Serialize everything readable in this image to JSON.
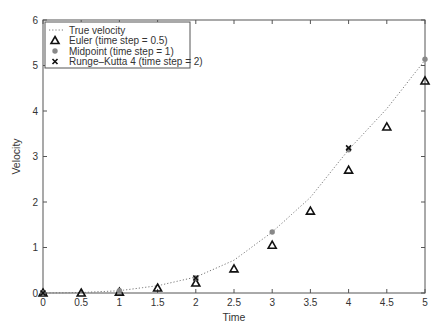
{
  "chart_data": {
    "type": "scatter",
    "title": "",
    "xlabel": "Time",
    "ylabel": "Velocity",
    "xlim": [
      0,
      5
    ],
    "ylim": [
      0,
      6
    ],
    "xticks": [
      "0",
      "0.5",
      "1",
      "1.5",
      "2",
      "2.5",
      "3",
      "3.5",
      "4",
      "4.5",
      "5"
    ],
    "yticks": [
      "0",
      "1",
      "2",
      "3",
      "4",
      "5",
      "6"
    ],
    "grid": false,
    "legend_position": "upper left",
    "series": [
      {
        "name": "True velocity",
        "style": "dotted-line",
        "x": [
          0,
          0.5,
          1,
          1.5,
          2,
          2.5,
          3,
          3.5,
          4,
          4.5,
          5
        ],
        "y": [
          0,
          0.01,
          0.05,
          0.16,
          0.35,
          0.72,
          1.34,
          2.1,
          3.15,
          4.05,
          5.12
        ]
      },
      {
        "name": "Euler (time step = 0.5)",
        "marker": "triangle",
        "x": [
          0,
          0.5,
          1,
          1.5,
          2,
          2.5,
          3,
          3.5,
          4,
          4.5,
          5
        ],
        "y": [
          0,
          0.0,
          0.02,
          0.11,
          0.22,
          0.53,
          1.05,
          1.8,
          2.7,
          3.65,
          4.66
        ]
      },
      {
        "name": "Midpoint (time step = 1)",
        "marker": "circle",
        "x": [
          0,
          1,
          2,
          3,
          4,
          5
        ],
        "y": [
          0,
          0.05,
          0.33,
          1.34,
          3.15,
          5.14
        ]
      },
      {
        "name": "Runge-Kutta 4 (time step = 2)",
        "marker": "x",
        "x": [
          0,
          2,
          4
        ],
        "y": [
          0,
          0.33,
          3.19
        ]
      }
    ]
  },
  "legend": {
    "items": [
      "True velocity",
      "Euler (time step = 0.5)",
      "Midpoint (time step = 1)",
      "Runge–Kutta 4 (time step = 2)"
    ]
  },
  "axes": {
    "xlabel": "Time",
    "ylabel": "Velocity"
  }
}
